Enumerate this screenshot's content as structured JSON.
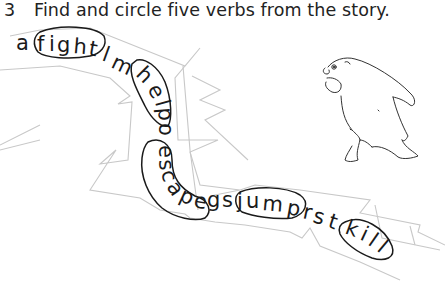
{
  "exercise": {
    "number": "3",
    "instruction": "Find and circle five verbs from the story."
  },
  "puzzle": {
    "letter_string": "afightlmhelpoescapegsjumprstkill",
    "letters": [
      {
        "ch": "a",
        "x": 16,
        "y": 46,
        "r": 0
      },
      {
        "ch": "f",
        "x": 38,
        "y": 46,
        "r": 0
      },
      {
        "ch": "i",
        "x": 49,
        "y": 47,
        "r": 0
      },
      {
        "ch": "g",
        "x": 57,
        "y": 47,
        "r": 0
      },
      {
        "ch": "h",
        "x": 73,
        "y": 48,
        "r": 5
      },
      {
        "ch": "t",
        "x": 87,
        "y": 50,
        "r": 10
      },
      {
        "ch": "l",
        "x": 101,
        "y": 56,
        "r": 20
      },
      {
        "ch": "m",
        "x": 109,
        "y": 62,
        "r": 25
      },
      {
        "ch": "h",
        "x": 133,
        "y": 76,
        "r": 45
      },
      {
        "ch": "e",
        "x": 144,
        "y": 91,
        "r": 60
      },
      {
        "ch": "l",
        "x": 151,
        "y": 104,
        "r": 75
      },
      {
        "ch": "p",
        "x": 151,
        "y": 113,
        "r": 85
      },
      {
        "ch": "o",
        "x": 151,
        "y": 128,
        "r": 90
      },
      {
        "ch": "e",
        "x": 151,
        "y": 147,
        "r": 90
      },
      {
        "ch": "s",
        "x": 151,
        "y": 162,
        "r": 85
      },
      {
        "ch": "c",
        "x": 154,
        "y": 176,
        "r": 75
      },
      {
        "ch": "a",
        "x": 160,
        "y": 190,
        "r": 55
      },
      {
        "ch": "p",
        "x": 175,
        "y": 199,
        "r": 25
      },
      {
        "ch": "e",
        "x": 191,
        "y": 205,
        "r": 10
      },
      {
        "ch": "g",
        "x": 205,
        "y": 204,
        "r": 0
      },
      {
        "ch": "s",
        "x": 221,
        "y": 205,
        "r": 0
      },
      {
        "ch": "j",
        "x": 238,
        "y": 206,
        "r": 0
      },
      {
        "ch": "u",
        "x": 247,
        "y": 206,
        "r": 0
      },
      {
        "ch": "m",
        "x": 262,
        "y": 208,
        "r": 5
      },
      {
        "ch": "p",
        "x": 285,
        "y": 213,
        "r": 10
      },
      {
        "ch": "r",
        "x": 301,
        "y": 218,
        "r": 12
      },
      {
        "ch": "s",
        "x": 311,
        "y": 222,
        "r": 15
      },
      {
        "ch": "t",
        "x": 326,
        "y": 227,
        "r": 18
      },
      {
        "ch": "k",
        "x": 345,
        "y": 234,
        "r": 20
      },
      {
        "ch": "i",
        "x": 360,
        "y": 240,
        "r": 25
      },
      {
        "ch": "l",
        "x": 368,
        "y": 245,
        "r": 35
      },
      {
        "ch": "l",
        "x": 377,
        "y": 251,
        "r": 40
      }
    ],
    "circled_verbs": [
      "fight",
      "help",
      "escape",
      "jump",
      "kill"
    ]
  },
  "illustration": {
    "subject": "bear-drawing"
  }
}
